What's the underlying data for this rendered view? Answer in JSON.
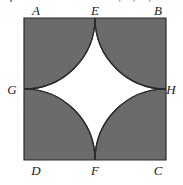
{
  "caption": {
    "text": "squares as shown. If A, E, G, and D are mid"
  },
  "figure": {
    "square": {
      "fill_color": "#6b6b6b",
      "stroke_color": "#2a2a2a",
      "stroke_width": 1.2,
      "left": 24,
      "top": 18,
      "side": 142
    },
    "center_region": {
      "name": "four-pointed-star",
      "fill_color": "#ffffff"
    },
    "arcs": [
      {
        "center": "A",
        "from": "E",
        "to": "G",
        "radius": 71
      },
      {
        "center": "B",
        "from": "E",
        "to": "H",
        "radius": 71
      },
      {
        "center": "C",
        "from": "H",
        "to": "F",
        "radius": 71
      },
      {
        "center": "D",
        "from": "F",
        "to": "G",
        "radius": 71
      }
    ],
    "labels": {
      "A": "A",
      "B": "B",
      "C": "C",
      "D": "D",
      "E": "E",
      "F": "F",
      "G": "G",
      "H": "H"
    }
  }
}
